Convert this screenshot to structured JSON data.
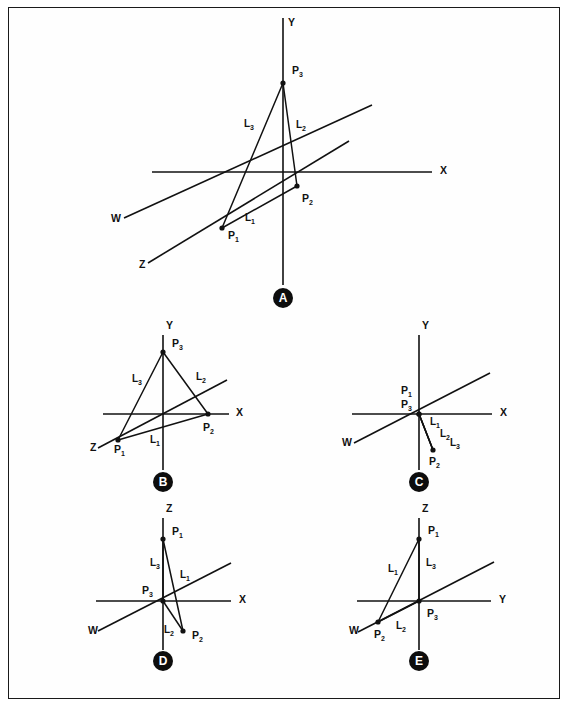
{
  "figure": {
    "background_color": "#ffffff",
    "ink_color": "#111111",
    "badge_fill": "#0d0d0d",
    "badge_text_color": "#ffffff"
  },
  "panels": [
    {
      "id": "A",
      "badge_label": "A",
      "badge": {
        "cx": 283,
        "cy": 298,
        "r": 10
      },
      "origin": {
        "x": 285,
        "y": 172
      },
      "axes": [
        {
          "name": "Y",
          "label": "Y",
          "label_x": 288,
          "label_y": 26,
          "x1": 283,
          "y1": 18,
          "x2": 283,
          "y2": 285
        },
        {
          "name": "X",
          "label": "X",
          "label_x": 440,
          "label_y": 174,
          "x1": 152,
          "y1": 172,
          "x2": 432,
          "y2": 172
        },
        {
          "name": "W",
          "label": "W",
          "label_x": 111,
          "label_y": 222,
          "x1": 124,
          "y1": 218,
          "x2": 372,
          "y2": 105
        },
        {
          "name": "Z",
          "label": "Z",
          "label_x": 139,
          "label_y": 268,
          "x1": 148,
          "y1": 263,
          "x2": 349,
          "y2": 141
        }
      ],
      "points": [
        {
          "name": "P1",
          "label": "P",
          "sub": "1",
          "x": 222,
          "y": 228,
          "label_x": 228,
          "label_y": 239
        },
        {
          "name": "P2",
          "label": "P",
          "sub": "2",
          "x": 297,
          "y": 186,
          "label_x": 302,
          "label_y": 202
        },
        {
          "name": "P3",
          "label": "P",
          "sub": "3",
          "x": 283,
          "y": 83,
          "label_x": 292,
          "label_y": 74
        }
      ],
      "segments": [
        {
          "name": "L1",
          "label": "L",
          "sub": "1",
          "x1": 222,
          "y1": 228,
          "x2": 297,
          "y2": 186,
          "label_x": 245,
          "label_y": 221
        },
        {
          "name": "L2",
          "label": "L",
          "sub": "2",
          "x1": 297,
          "y1": 186,
          "x2": 283,
          "y2": 83,
          "label_x": 296,
          "label_y": 128
        },
        {
          "name": "L3",
          "label": "L",
          "sub": "3",
          "x1": 283,
          "y1": 83,
          "x2": 222,
          "y2": 228,
          "label_x": 244,
          "label_y": 127
        }
      ]
    },
    {
      "id": "B",
      "badge_label": "B",
      "badge": {
        "cx": 163,
        "cy": 482,
        "r": 10
      },
      "origin": {
        "x": 163,
        "y": 414
      },
      "axes": [
        {
          "name": "Y",
          "label": "Y",
          "label_x": 166,
          "label_y": 329,
          "x1": 163,
          "y1": 335,
          "x2": 163,
          "y2": 470
        },
        {
          "name": "X",
          "label": "X",
          "label_x": 236,
          "label_y": 416,
          "x1": 103,
          "y1": 414,
          "x2": 229,
          "y2": 414
        },
        {
          "name": "Z",
          "label": "Z",
          "label_x": 90,
          "label_y": 451,
          "x1": 98,
          "y1": 448,
          "x2": 227,
          "y2": 380
        }
      ],
      "points": [
        {
          "name": "P1",
          "label": "P",
          "sub": "1",
          "x": 118,
          "y": 440,
          "label_x": 114,
          "label_y": 453
        },
        {
          "name": "P2",
          "label": "P",
          "sub": "2",
          "x": 208,
          "y": 414,
          "label_x": 203,
          "label_y": 431
        },
        {
          "name": "P3",
          "label": "P",
          "sub": "3",
          "x": 163,
          "y": 352,
          "label_x": 172,
          "label_y": 347
        }
      ],
      "segments": [
        {
          "name": "L1",
          "label": "L",
          "sub": "1",
          "x1": 118,
          "y1": 440,
          "x2": 208,
          "y2": 414,
          "label_x": 150,
          "label_y": 443
        },
        {
          "name": "L2",
          "label": "L",
          "sub": "2",
          "x1": 208,
          "y1": 414,
          "x2": 163,
          "y2": 352,
          "label_x": 196,
          "label_y": 380
        },
        {
          "name": "L3",
          "label": "L",
          "sub": "3",
          "x1": 163,
          "y1": 352,
          "x2": 118,
          "y2": 440,
          "label_x": 132,
          "label_y": 382
        }
      ]
    },
    {
      "id": "C",
      "badge_label": "C",
      "badge": {
        "cx": 419,
        "cy": 482,
        "r": 10
      },
      "origin": {
        "x": 419,
        "y": 414
      },
      "axes": [
        {
          "name": "Y",
          "label": "Y",
          "label_x": 422,
          "label_y": 329,
          "x1": 419,
          "y1": 335,
          "x2": 419,
          "y2": 470
        },
        {
          "name": "X",
          "label": "X",
          "label_x": 500,
          "label_y": 416,
          "x1": 352,
          "y1": 414,
          "x2": 492,
          "y2": 414
        },
        {
          "name": "W",
          "label": "W",
          "label_x": 342,
          "label_y": 446,
          "x1": 354,
          "y1": 443,
          "x2": 490,
          "y2": 373
        }
      ],
      "points": [
        {
          "name": "P1",
          "label": "P",
          "sub": "1",
          "x": 419,
          "y": 414,
          "label_x": 401,
          "label_y": 394
        },
        {
          "name": "P2",
          "label": "P",
          "sub": "2",
          "x": 433,
          "y": 450,
          "label_x": 429,
          "label_y": 465
        },
        {
          "name": "P3",
          "label": "P",
          "sub": "3",
          "x": 419,
          "y": 414,
          "label_x": 401,
          "label_y": 408
        }
      ],
      "segments": [
        {
          "name": "L1",
          "label": "L",
          "sub": "1",
          "x1": 419,
          "y1": 414,
          "x2": 433,
          "y2": 450,
          "label_x": 430,
          "label_y": 425
        },
        {
          "name": "L2",
          "label": "L",
          "sub": "2",
          "x1": 419,
          "y1": 414,
          "x2": 433,
          "y2": 450,
          "label_x": 440,
          "label_y": 437
        },
        {
          "name": "L3",
          "label": "L",
          "sub": "3",
          "x1": 419,
          "y1": 414,
          "x2": 433,
          "y2": 450,
          "label_x": 450,
          "label_y": 446
        }
      ]
    },
    {
      "id": "D",
      "badge_label": "D",
      "badge": {
        "cx": 163,
        "cy": 661,
        "r": 10
      },
      "origin": {
        "x": 163,
        "y": 601
      },
      "axes": [
        {
          "name": "Z",
          "label": "Z",
          "label_x": 166,
          "label_y": 512,
          "x1": 163,
          "y1": 518,
          "x2": 163,
          "y2": 650
        },
        {
          "name": "X",
          "label": "X",
          "label_x": 239,
          "label_y": 603,
          "x1": 96,
          "y1": 601,
          "x2": 231,
          "y2": 601
        },
        {
          "name": "W",
          "label": "W",
          "label_x": 88,
          "label_y": 634,
          "x1": 98,
          "y1": 631,
          "x2": 231,
          "y2": 563
        }
      ],
      "points": [
        {
          "name": "P1",
          "label": "P",
          "sub": "1",
          "x": 163,
          "y": 539,
          "label_x": 172,
          "label_y": 535
        },
        {
          "name": "P2",
          "label": "P",
          "sub": "2",
          "x": 183,
          "y": 631,
          "label_x": 192,
          "label_y": 639
        },
        {
          "name": "P3",
          "label": "P",
          "sub": "3",
          "x": 163,
          "y": 601,
          "label_x": 142,
          "label_y": 594
        }
      ],
      "segments": [
        {
          "name": "L1",
          "label": "L",
          "sub": "1",
          "x1": 163,
          "y1": 539,
          "x2": 183,
          "y2": 631,
          "label_x": 180,
          "label_y": 578
        },
        {
          "name": "L2",
          "label": "L",
          "sub": "2",
          "x1": 183,
          "y1": 631,
          "x2": 163,
          "y2": 601,
          "label_x": 164,
          "label_y": 633
        },
        {
          "name": "L3",
          "label": "L",
          "sub": "3",
          "x1": 163,
          "y1": 601,
          "x2": 163,
          "y2": 539,
          "label_x": 150,
          "label_y": 566
        }
      ]
    },
    {
      "id": "E",
      "badge_label": "E",
      "badge": {
        "cx": 419,
        "cy": 661,
        "r": 10
      },
      "origin": {
        "x": 419,
        "y": 601
      },
      "axes": [
        {
          "name": "Z",
          "label": "Z",
          "label_x": 422,
          "label_y": 512,
          "x1": 419,
          "y1": 518,
          "x2": 419,
          "y2": 650
        },
        {
          "name": "Y",
          "label": "Y",
          "label_x": 499,
          "label_y": 603,
          "x1": 357,
          "y1": 601,
          "x2": 491,
          "y2": 601
        },
        {
          "name": "W",
          "label": "W",
          "label_x": 349,
          "label_y": 634,
          "x1": 358,
          "y1": 632,
          "x2": 494,
          "y2": 562
        }
      ],
      "points": [
        {
          "name": "P1",
          "label": "P",
          "sub": "1",
          "x": 419,
          "y": 539,
          "label_x": 428,
          "label_y": 534
        },
        {
          "name": "P2",
          "label": "P",
          "sub": "2",
          "x": 378,
          "y": 622,
          "label_x": 374,
          "label_y": 638
        },
        {
          "name": "P3",
          "label": "P",
          "sub": "3",
          "x": 419,
          "y": 601,
          "label_x": 427,
          "label_y": 617
        }
      ],
      "segments": [
        {
          "name": "L1",
          "label": "L",
          "sub": "1",
          "x1": 378,
          "y1": 622,
          "x2": 419,
          "y2": 539,
          "label_x": 388,
          "label_y": 572
        },
        {
          "name": "L2",
          "label": "L",
          "sub": "2",
          "x1": 378,
          "y1": 622,
          "x2": 419,
          "y2": 601,
          "label_x": 396,
          "label_y": 629
        },
        {
          "name": "L3",
          "label": "L",
          "sub": "3",
          "x1": 419,
          "y1": 601,
          "x2": 419,
          "y2": 539,
          "label_x": 426,
          "label_y": 566
        }
      ]
    }
  ]
}
